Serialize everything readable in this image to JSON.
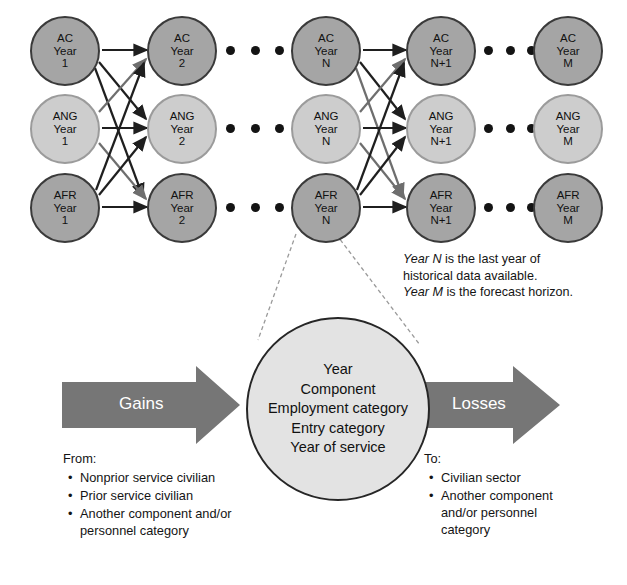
{
  "diagram": {
    "columns": [
      {
        "id": "year1",
        "nodes": [
          {
            "component": "AC",
            "line2": "Year",
            "line3": "1",
            "tone": "dark"
          },
          {
            "component": "ANG",
            "line2": "Year",
            "line3": "1",
            "tone": "light"
          },
          {
            "component": "AFR",
            "line2": "Year",
            "line3": "1",
            "tone": "dark"
          }
        ]
      },
      {
        "id": "year2",
        "nodes": [
          {
            "component": "AC",
            "line2": "Year",
            "line3": "2",
            "tone": "dark"
          },
          {
            "component": "ANG",
            "line2": "Year",
            "line3": "2",
            "tone": "light"
          },
          {
            "component": "AFR",
            "line2": "Year",
            "line3": "2",
            "tone": "dark"
          }
        ]
      },
      {
        "id": "yearN",
        "nodes": [
          {
            "component": "AC",
            "line2": "Year",
            "line3": "N",
            "tone": "dark"
          },
          {
            "component": "ANG",
            "line2": "Year",
            "line3": "N",
            "tone": "light"
          },
          {
            "component": "AFR",
            "line2": "Year",
            "line3": "N",
            "tone": "dark"
          }
        ]
      },
      {
        "id": "yearN1",
        "nodes": [
          {
            "component": "AC",
            "line2": "Year",
            "line3": "N+1",
            "tone": "dark"
          },
          {
            "component": "ANG",
            "line2": "Year",
            "line3": "N+1",
            "tone": "light"
          },
          {
            "component": "AFR",
            "line2": "Year",
            "line3": "N+1",
            "tone": "dark"
          }
        ]
      },
      {
        "id": "yearM",
        "nodes": [
          {
            "component": "AC",
            "line2": "Year",
            "line3": "M",
            "tone": "dark"
          },
          {
            "component": "ANG",
            "line2": "Year",
            "line3": "M",
            "tone": "light"
          },
          {
            "component": "AFR",
            "line2": "Year",
            "line3": "M",
            "tone": "dark"
          }
        ]
      }
    ],
    "notes": {
      "line1_italic": "Year N",
      "line1_rest": " is the last year of",
      "line2": "historical data available.",
      "line3_italic": "Year M",
      "line3_rest": " is the forecast horizon."
    },
    "cell": {
      "dimensions": [
        "Year",
        "Component",
        "Employment category",
        "Entry category",
        "Year of service"
      ]
    },
    "flows": {
      "gains_label": "Gains",
      "losses_label": "Losses"
    },
    "from_block": {
      "lead": "From:",
      "items": [
        "Nonprior service civilian",
        "Prior service civilian",
        "Another component and/or personnel category"
      ]
    },
    "to_block": {
      "lead": "To:",
      "items": [
        "Civilian sector",
        "Another component and/or personnel category"
      ]
    },
    "colors": {
      "node_dark_fill": "#a5a5a5",
      "node_dark_border": "#3a3a3a",
      "node_light_fill": "#cdcdcd",
      "node_light_border": "#9b9b9b",
      "arrow_block": "#767676",
      "cell_fill": "#e3a3a3",
      "edge": "#1f1f1f"
    }
  }
}
